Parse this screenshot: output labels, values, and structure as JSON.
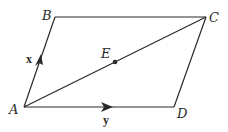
{
  "diagram": {
    "type": "parallelogram",
    "colors": {
      "stroke": "#2a2a2a",
      "background": "#ffffff"
    },
    "vertices": [
      {
        "id": "A",
        "label": "A",
        "x": 24,
        "y": 107
      },
      {
        "id": "B",
        "label": "B",
        "x": 55,
        "y": 17
      },
      {
        "id": "C",
        "label": "C",
        "x": 206,
        "y": 17
      },
      {
        "id": "D",
        "label": "D",
        "x": 174,
        "y": 107
      }
    ],
    "edges": [
      {
        "from": "A",
        "to": "B"
      },
      {
        "from": "B",
        "to": "C"
      },
      {
        "from": "C",
        "to": "D"
      },
      {
        "from": "D",
        "to": "A"
      },
      {
        "from": "A",
        "to": "C",
        "kind": "diagonal"
      }
    ],
    "points": [
      {
        "id": "E",
        "label": "E",
        "x": 115,
        "y": 62,
        "note": "midpoint of AC"
      }
    ],
    "vectors": [
      {
        "label": "x",
        "along": "AB",
        "arrow_at": [
          39,
          60
        ]
      },
      {
        "label": "y",
        "along": "AD",
        "arrow_at": [
          108,
          107
        ]
      }
    ]
  }
}
